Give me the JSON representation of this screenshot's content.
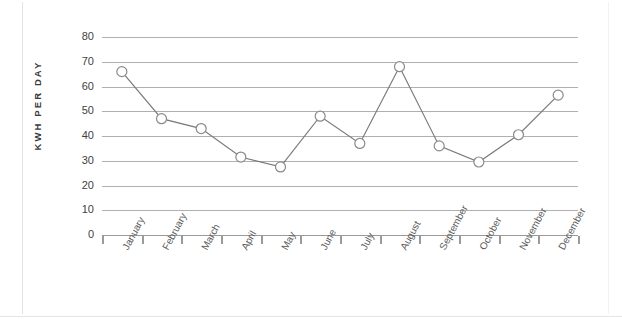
{
  "chart_data": {
    "type": "line",
    "title": "",
    "xlabel": "",
    "ylabel": "KWH PER DAY",
    "categories": [
      "January",
      "February",
      "March",
      "April",
      "May",
      "June",
      "July",
      "August",
      "September",
      "October",
      "November",
      "December"
    ],
    "values": [
      66,
      47,
      43,
      31.5,
      27.5,
      48,
      37,
      68,
      36,
      29.5,
      40.5,
      56.5
    ],
    "series": [
      {
        "name": "KWH per day",
        "values": [
          66,
          47,
          43,
          31.5,
          27.5,
          48,
          37,
          68,
          36,
          29.5,
          40.5,
          56.5
        ]
      }
    ],
    "ylim": [
      0,
      80
    ],
    "ytick_labels": [
      "80",
      "70",
      "60",
      "50",
      "40",
      "30",
      "20",
      "10",
      "0"
    ],
    "ytick_values": [
      80,
      70,
      60,
      50,
      40,
      30,
      20,
      10,
      0
    ],
    "grid": "horizontal",
    "legend": "none",
    "marker": "open-circle",
    "line_color": "#7a7a7a",
    "marker_color": "#8a8a8a",
    "gridline_color": "#b0b0b0",
    "axis_color": "#9a9a9a",
    "text_color": "#3f3f3f"
  }
}
